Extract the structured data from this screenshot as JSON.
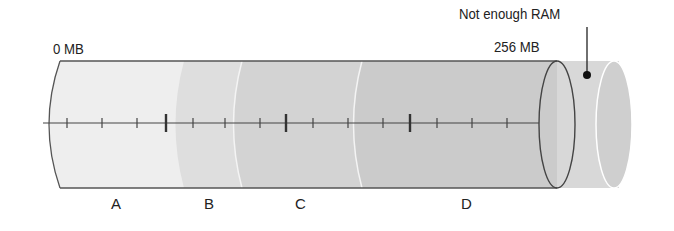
{
  "diagram": {
    "start_label": "0 MB",
    "end_label": "256 MB",
    "overflow_label": "Not enough RAM",
    "segments": [
      {
        "label": "A",
        "color": "#ececec"
      },
      {
        "label": "B",
        "color": "#dedede"
      },
      {
        "label": "C",
        "color": "#d3d3d3"
      },
      {
        "label": "D",
        "color": "#cbcbcb"
      }
    ],
    "overflow_color": "#d6d6d6"
  }
}
